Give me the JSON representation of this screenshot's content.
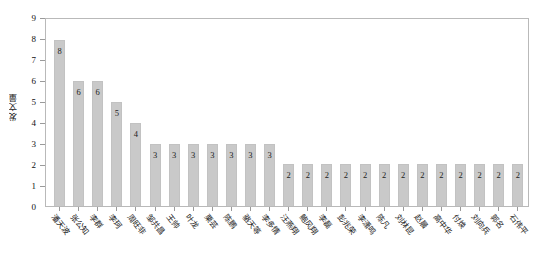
{
  "chart_data": {
    "type": "bar",
    "title": "",
    "xlabel": "",
    "ylabel": "发文量",
    "ylim": [
      0,
      9
    ],
    "yticks": [
      0,
      1,
      2,
      3,
      4,
      5,
      6,
      7,
      8,
      9
    ],
    "grid": false,
    "legend": null,
    "bar_color": "#c9c9c9",
    "frame_color": "#b9b9b9",
    "categories": [
      "潘天波",
      "张公知",
      "李群",
      "李珂",
      "周旺非",
      "邹共昌",
      "王帅",
      "叶龙",
      "栗芸",
      "陈鹏",
      "骆天等",
      "李多情",
      "汪燕翔",
      "鲍风翔",
      "李磊",
      "彭兆荣",
      "李潇鸣",
      "陈凡",
      "刘林昆",
      "赵晨",
      "高中华",
      "付焕",
      "刘向兵",
      "郭名",
      "石伟平"
    ],
    "values": [
      8,
      6,
      6,
      5,
      4,
      3,
      3,
      3,
      3,
      3,
      3,
      3,
      2,
      2,
      2,
      2,
      2,
      2,
      2,
      2,
      2,
      2,
      2,
      2,
      2
    ],
    "value_labels": [
      "8",
      "6",
      "6",
      "5",
      "4",
      "3",
      "3",
      "3",
      "3",
      "3",
      "3",
      "3",
      "2",
      "2",
      "2",
      "2",
      "2",
      "2",
      "2",
      "2",
      "2",
      "2",
      "2",
      "2",
      "2"
    ],
    "ytick_labels": [
      "0",
      "1",
      "2",
      "3",
      "4",
      "5",
      "6",
      "7",
      "8",
      "9"
    ]
  }
}
